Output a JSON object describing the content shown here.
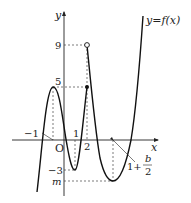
{
  "diagram": {
    "function_label": "y=f(x)",
    "axes": {
      "x_label": "x",
      "y_label": "y",
      "origin_label": "O"
    },
    "x_ticks": [
      {
        "label": "−1",
        "note": "local maximum x-position (left of origin)"
      },
      {
        "label": "1"
      },
      {
        "label": "2"
      }
    ],
    "y_ticks": [
      {
        "label": "9"
      },
      {
        "label": "5"
      },
      {
        "label": "−3"
      },
      {
        "label": "m"
      }
    ],
    "annotation": {
      "prefix": "1+",
      "frac_numerator": "b",
      "frac_denominator": "2"
    },
    "points": {
      "open_circle": {
        "x": "2",
        "y": "9"
      },
      "filled_dot": {
        "x": "2",
        "y": "5"
      },
      "local_max": {
        "y": "5"
      },
      "local_min_1": {
        "x": "1",
        "y": "−3"
      },
      "local_min_2": {
        "x": "1+b/2",
        "y": "m"
      }
    },
    "colors": {
      "curve": "#111111",
      "axes": "#222222",
      "dashed": "#444444"
    }
  }
}
